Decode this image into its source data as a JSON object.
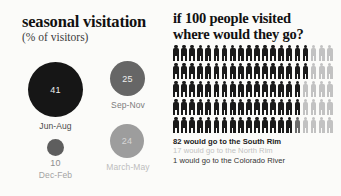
{
  "background_color": "#fbfbf9",
  "left_panel": {
    "title": "seasonal visitation",
    "subtitle": "(% of visitors)",
    "bubbles": [
      {
        "value": "41",
        "label": "Jun-Aug",
        "percent": 41,
        "color": "#161616",
        "value_color": "#efefef",
        "label_color": "#4a4a4a",
        "value_inside": true
      },
      {
        "value": "25",
        "label": "Sep-Nov",
        "percent": 25,
        "color": "#666666",
        "value_color": "#e8e8e8",
        "label_color": "#7c7c7c",
        "value_inside": true
      },
      {
        "value": "10",
        "label": "Dec-Feb",
        "percent": 10,
        "color": "#5e5e5e",
        "value_color": "#9a9a9a",
        "label_color": "#a3a3a3",
        "value_inside": false
      },
      {
        "value": "24",
        "label": "March-May",
        "percent": 24,
        "color": "#9d9d9d",
        "value_color": "#d6d6d6",
        "label_color": "#bdbdbd",
        "value_inside": true
      }
    ]
  },
  "right_panel": {
    "heading_line1": "if 100 people visited",
    "heading_line2": "where would they go?",
    "legend": [
      {
        "text": "82 would go to the South Rim",
        "color": "#1a1a1a",
        "bold": true
      },
      {
        "text": "17 would go to the North Rim",
        "color": "#c2c2c2",
        "bold": false
      },
      {
        "text": "1 would go to the Colorado River",
        "color": "#333333",
        "bold": false
      }
    ]
  },
  "chart_data": {
    "type": "pictogram",
    "title": "if 100 people visited where would they go?",
    "total": 100,
    "columns": 20,
    "rows": 5,
    "categories": [
      "South Rim",
      "North Rim",
      "Colorado River"
    ],
    "values": [
      82,
      17,
      1
    ],
    "colors": [
      "#1a1a1a",
      "#c2c2c2",
      "#6b6b6b"
    ],
    "row_breakdown": [
      {
        "row": 1,
        "dark": 17,
        "light": 3
      },
      {
        "row": 2,
        "dark": 17,
        "light": 3
      },
      {
        "row": 3,
        "dark": 16,
        "light": 4
      },
      {
        "row": 4,
        "dark": 16,
        "light": 4
      },
      {
        "row": 5,
        "dark": 16,
        "light": 4
      }
    ],
    "second_chart": {
      "type": "bubble",
      "title": "seasonal visitation",
      "ylabel": "(% of visitors)",
      "categories": [
        "Jun-Aug",
        "Sep-Nov",
        "Dec-Feb",
        "March-May"
      ],
      "values": [
        41,
        25,
        10,
        24
      ],
      "unit": "% of visitors"
    }
  }
}
